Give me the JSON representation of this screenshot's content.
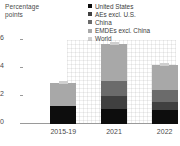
{
  "chart_data": {
    "type": "bar",
    "stacked": true,
    "title": "Percentage points",
    "xlabel": "",
    "ylabel": "Percentage points",
    "ylim": [
      0,
      6
    ],
    "yticks": [
      0,
      2,
      4,
      6
    ],
    "grid": true,
    "legend_position": "top-right",
    "categories": [
      "2015-19",
      "2021",
      "2022"
    ],
    "series": [
      {
        "name": "United States",
        "values": [
          1.3,
          1.1,
          1.0
        ],
        "color": "#0d0d0d"
      },
      {
        "name": "AEs excl. U.S.",
        "values": [
          0.0,
          0.9,
          0.6
        ],
        "color": "#404040"
      },
      {
        "name": "China",
        "values": [
          0.0,
          1.1,
          0.8
        ],
        "color": "#6b6b6b"
      },
      {
        "name": "EMDEs excl. China",
        "values": [
          1.6,
          2.6,
          1.8
        ],
        "color": "#a8a8a8"
      }
    ],
    "markers": {
      "name": "World",
      "color": "#cfcfcf",
      "values": [
        2.9,
        5.7,
        4.2
      ]
    }
  },
  "axis": {
    "title": "Percentage\npoints",
    "tick_labels": [
      "6",
      "4",
      "2",
      "0"
    ],
    "category_labels": [
      "2015-19",
      "2021",
      "2022"
    ]
  },
  "legend": {
    "items": [
      {
        "label": "United States",
        "color": "#0d0d0d"
      },
      {
        "label": "AEs excl. U.S.",
        "color": "#404040"
      },
      {
        "label": "China",
        "color": "#6b6b6b"
      },
      {
        "label": "EMDEs excl. China",
        "color": "#a8a8a8"
      },
      {
        "label": "World",
        "color": "#cfcfcf"
      }
    ]
  }
}
